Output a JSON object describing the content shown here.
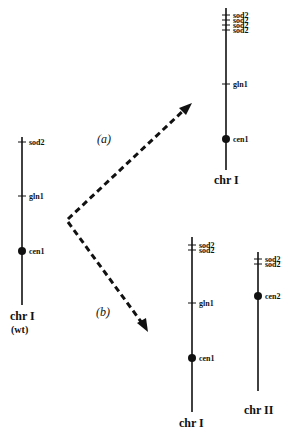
{
  "figure": {
    "panels": {
      "a": "(a)",
      "b": "(b)"
    },
    "wild_type": {
      "name": "chr I",
      "sub": "(wt)",
      "markers": {
        "sod2": "sod2",
        "gln1": "gln1",
        "cen1": "cen1"
      }
    },
    "result_a": {
      "name": "chr I",
      "markers": {
        "sod2_1": "sod2",
        "sod2_2": "sod2",
        "sod2_3": "sod2",
        "sod2_4": "sod2",
        "gln1": "gln1",
        "cen1": "cen1"
      }
    },
    "result_b_chr1": {
      "name": "chr I",
      "markers": {
        "sod2_1": "sod2",
        "sod2_2": "sod2",
        "gln1": "gln1",
        "cen1": "cen1"
      }
    },
    "result_b_chr2": {
      "name": "chr II",
      "markers": {
        "sod2_1": "sod2",
        "sod2_2": "sod2",
        "cen2": "cen2"
      }
    },
    "colors": {
      "ink": "#111111",
      "background": "#ffffff"
    }
  }
}
